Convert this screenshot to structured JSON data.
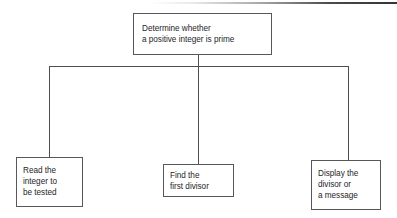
{
  "diagram": {
    "type": "structure-chart",
    "title_text": "Determine whether\na positive integer is prime",
    "root": {
      "id": "determine-prime",
      "label": "Determine whether\na positive integer is prime"
    },
    "children": [
      {
        "id": "read-integer",
        "label": "Read the\ninteger to\nbe tested"
      },
      {
        "id": "find-divisor",
        "label": "Find the\nfirst divisor"
      },
      {
        "id": "display-result",
        "label": "Display the\ndivisor or\na message"
      }
    ],
    "colors": {
      "border": "#58585a",
      "text": "#262628",
      "connector": "#4f4f51",
      "background": "#ffffff"
    }
  }
}
